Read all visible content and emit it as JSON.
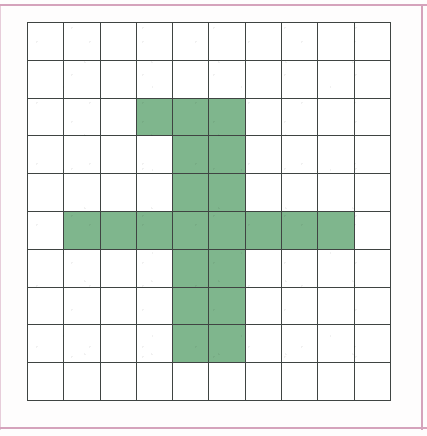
{
  "figure": {
    "kind": "grid-shading-figure",
    "border_color": "#d5a3bc",
    "grid_line_color": "#3f4442",
    "cell_fill_color": "#7fb68d",
    "cell_empty_color": "#ffffff",
    "background_color": "#fefdfd"
  },
  "chart_data": {
    "type": "heatmap",
    "xlabel": "",
    "ylabel": "",
    "rows": 10,
    "columns": 10,
    "grid": true,
    "legend": "none",
    "categories": [
      "1",
      "2",
      "3",
      "4",
      "5",
      "6",
      "7",
      "8",
      "9",
      "10"
    ],
    "row_labels": [
      "1",
      "2",
      "3",
      "4",
      "5",
      "6",
      "7",
      "8",
      "9",
      "10"
    ],
    "values": [
      [
        0,
        0,
        0,
        0,
        0,
        0,
        0,
        0,
        0,
        0
      ],
      [
        0,
        0,
        0,
        0,
        0,
        0,
        0,
        0,
        0,
        0
      ],
      [
        0,
        0,
        0,
        1,
        1,
        1,
        0,
        0,
        0,
        0
      ],
      [
        0,
        0,
        0,
        0,
        1,
        1,
        0,
        0,
        0,
        0
      ],
      [
        0,
        0,
        0,
        0,
        1,
        1,
        0,
        0,
        0,
        0
      ],
      [
        0,
        1,
        1,
        1,
        1,
        1,
        1,
        1,
        1,
        0
      ],
      [
        0,
        0,
        0,
        0,
        1,
        1,
        0,
        0,
        0,
        0
      ],
      [
        0,
        0,
        0,
        0,
        1,
        1,
        0,
        0,
        0,
        0
      ],
      [
        0,
        0,
        0,
        0,
        1,
        1,
        0,
        0,
        0,
        0
      ],
      [
        0,
        0,
        0,
        0,
        0,
        0,
        0,
        0,
        0,
        0
      ]
    ],
    "shaded_cells_count": 21,
    "total_cells": 100,
    "shaded_fraction": "21/100",
    "colorscale": {
      "0": "#ffffff",
      "1": "#7fb68d"
    }
  }
}
